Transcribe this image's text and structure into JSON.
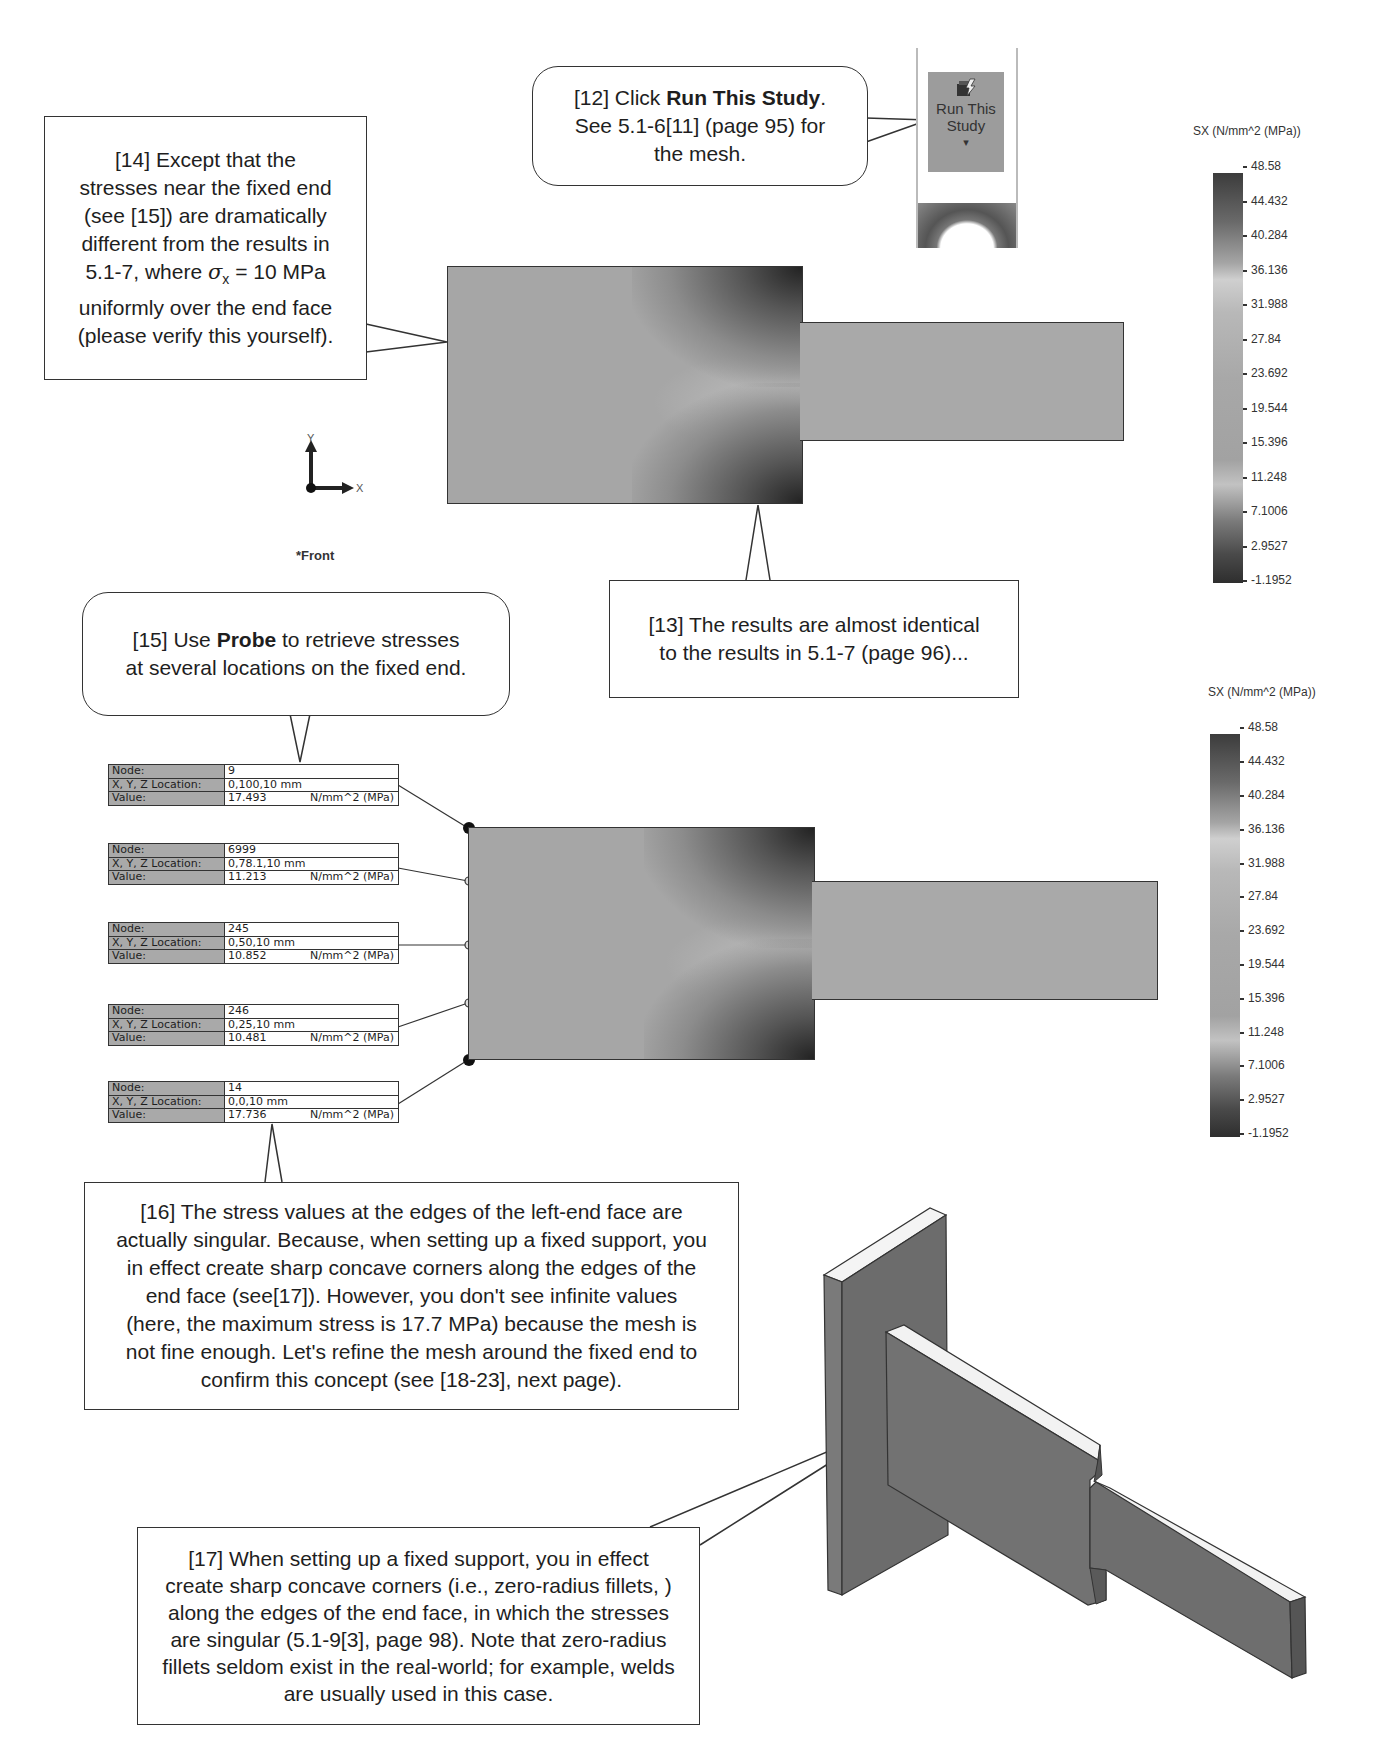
{
  "callouts": {
    "step12": {
      "prefix": "[12] Click ",
      "bold": "Run This Study",
      "suffix": ".",
      "line2": "See 5.1-6[11] (page 95) for",
      "line3": "the mesh."
    },
    "step13": {
      "line1": "[13] The results are almost identical",
      "line2": "to the results in 5.1-7 (page 96)..."
    },
    "step14": {
      "line1": "[14] Except that the",
      "line2": "stresses near the fixed end",
      "line3": "(see [15]) are dramatically",
      "line4": "different from the results in",
      "line5a": "5.1-7, where ",
      "sigma": "σ",
      "sub": "x",
      "line5b": " = 10 MPa",
      "line6": "uniformly over the end face",
      "line7": "(please verify this yourself)."
    },
    "step15": {
      "prefix": "[15] Use ",
      "bold": "Probe",
      "suffix": " to retrieve stresses",
      "line2": "at several locations on the fixed end."
    },
    "step16": {
      "lines": [
        "[16] The stress values at the edges of the left-end face are",
        "actually singular.  Because, when setting up a fixed support, you",
        "in effect create sharp concave corners along the edges of the",
        "end face (see[17]).  However, you don't see infinite values",
        "(here, the maximum stress is 17.7 MPa) because the mesh is",
        "not fine enough.  Let's refine the mesh around the fixed end to",
        "confirm this concept (see [18-23], next page)."
      ]
    },
    "step17": {
      "lines": [
        "[17] When setting up a fixed support, you in effect",
        "create sharp concave corners (i.e., zero-radius fillets, )",
        "along the edges of the end face, in which the stresses",
        "are singular (5.1-9[3], page 98).  Note that zero-radius",
        "fillets seldom exist in the real-world; for example, welds",
        "are usually used in this case."
      ]
    }
  },
  "ribbon": {
    "button_label_1": "Run This",
    "button_label_2": "Study",
    "dropdown_arrow": "▾",
    "icon": "run-study-icon"
  },
  "triad": {
    "y": "Y",
    "x": "X",
    "view": "*Front"
  },
  "legend": {
    "title": "SX (N/mm^2 (MPa))",
    "ticks": [
      "48.58",
      "44.432",
      "40.284",
      "36.136",
      "31.988",
      "27.84",
      "23.692",
      "19.544",
      "15.396",
      "11.248",
      "7.1006",
      "2.9527",
      "-1.1952"
    ]
  },
  "probes": [
    {
      "node_label": "Node:",
      "node": "9",
      "loc_label": "X, Y, Z Location:",
      "loc": "0,100,10 mm",
      "value_label": "Value:",
      "value": "17.493",
      "unit": "N/mm^2 (MPa)"
    },
    {
      "node_label": "Node:",
      "node": "6999",
      "loc_label": "X, Y, Z Location:",
      "loc": "0,78.1,10 mm",
      "value_label": "Value:",
      "value": "11.213",
      "unit": "N/mm^2 (MPa)"
    },
    {
      "node_label": "Node:",
      "node": "245",
      "loc_label": "X, Y, Z Location:",
      "loc": "0,50,10 mm",
      "value_label": "Value:",
      "value": "10.852",
      "unit": "N/mm^2 (MPa)"
    },
    {
      "node_label": "Node:",
      "node": "246",
      "loc_label": "X, Y, Z Location:",
      "loc": "0,25,10 mm",
      "value_label": "Value:",
      "value": "10.481",
      "unit": "N/mm^2 (MPa)"
    },
    {
      "node_label": "Node:",
      "node": "14",
      "loc_label": "X, Y, Z Location:",
      "loc": "0,0,10 mm",
      "value_label": "Value:",
      "value": "17.736",
      "unit": "N/mm^2 (MPa)"
    }
  ]
}
